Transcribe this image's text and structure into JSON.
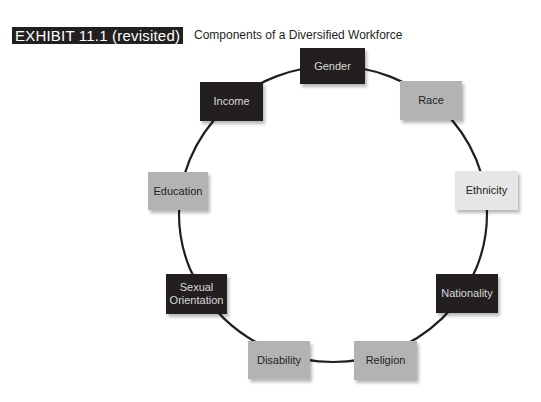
{
  "header": {
    "exhibit_label": "EXHIBIT 11.1 (revisited)",
    "title": "Components of a Diversified Workforce"
  },
  "diagram": {
    "type": "cycle",
    "colors": {
      "dark": "#231f20",
      "mid": "#b3b3b3",
      "light": "#e6e6e6",
      "ring": "#231f20"
    },
    "nodes": [
      {
        "label": "Gender",
        "shade": "dark"
      },
      {
        "label": "Race",
        "shade": "mid"
      },
      {
        "label": "Ethnicity",
        "shade": "light"
      },
      {
        "label": "Nationality",
        "shade": "dark"
      },
      {
        "label": "Religion",
        "shade": "mid"
      },
      {
        "label": "Disability",
        "shade": "mid"
      },
      {
        "label": "Sexual Orientation",
        "shade": "dark"
      },
      {
        "label": "Education",
        "shade": "mid"
      },
      {
        "label": "Income",
        "shade": "dark"
      }
    ]
  }
}
